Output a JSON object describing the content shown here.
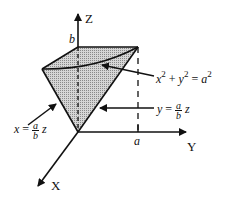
{
  "diagram": {
    "type": "3d-solid-region",
    "colors": {
      "stroke": "#111111",
      "fill": "#bdbdbd",
      "background": "#ffffff"
    },
    "axes": {
      "z_label": "Z",
      "y_label": "Y",
      "x_label": "X",
      "z_tick": "b",
      "y_tick": "a"
    },
    "annotations": {
      "cylinder": {
        "lhs_x": "x",
        "lhs_exp": "2",
        "plus": "+",
        "lhs_y": "y",
        "lhs_exp2": "2",
        "eq": "=",
        "rhs": "a",
        "rhs_exp": "2"
      },
      "plane_y": {
        "var": "y",
        "eq": "=",
        "num": "a",
        "den": "b",
        "z": "z"
      },
      "plane_x": {
        "var": "x",
        "eq": "=",
        "num": "a",
        "den": "b",
        "z": "z"
      }
    }
  }
}
